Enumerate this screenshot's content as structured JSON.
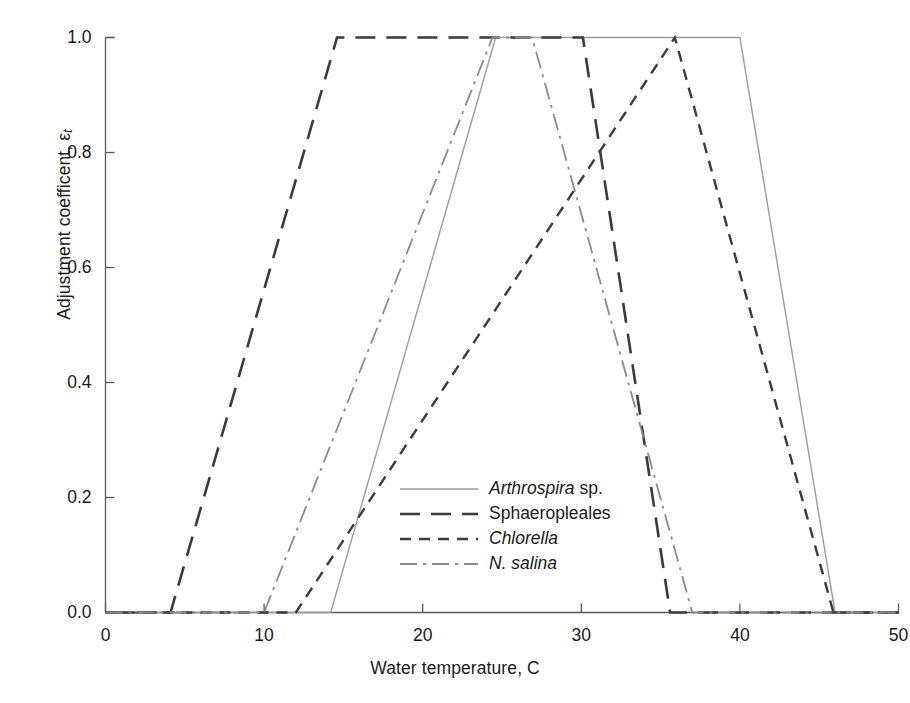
{
  "chart_data": {
    "type": "line",
    "title": "",
    "xlabel": "Water temperature, C",
    "ylabel": "Adjustment coefficent, ε",
    "ylabel_sub": "t",
    "xlim": [
      0,
      50
    ],
    "ylim": [
      0.0,
      1.0
    ],
    "xticks": [
      "0",
      "10",
      "20",
      "30",
      "40",
      "50"
    ],
    "xtick_values": [
      0,
      10,
      20,
      30,
      40,
      50
    ],
    "yticks": [
      "0.0",
      "0.2",
      "0.4",
      "0.6",
      "0.8",
      "1.0"
    ],
    "ytick_values": [
      0.0,
      0.2,
      0.4,
      0.6,
      0.8,
      1.0
    ],
    "grid": false,
    "legend_position": "center-right-inside",
    "series": [
      {
        "name": "Arthrospira sp.",
        "label_italic_part": "Arthrospira",
        "label_roman_part": "sp.",
        "dash": "solid",
        "color": "#9b9b9b",
        "width": 1.4,
        "points": [
          [
            0,
            0.0
          ],
          [
            14.2,
            0.0
          ],
          [
            24.6,
            1.0
          ],
          [
            40.0,
            1.0
          ],
          [
            46.0,
            0.0
          ],
          [
            50,
            0.0
          ]
        ]
      },
      {
        "name": "Sphaeropleales",
        "label_italic_part": "",
        "label_roman_part": "Sphaeropleales",
        "dash": "long-dash",
        "color": "#3b3b3b",
        "width": 2.6,
        "points": [
          [
            0,
            0.0
          ],
          [
            4.1,
            0.0
          ],
          [
            14.6,
            1.0
          ],
          [
            30.1,
            1.0
          ],
          [
            35.6,
            0.0
          ],
          [
            50,
            0.0
          ]
        ]
      },
      {
        "name": "Chlorella",
        "label_italic_part": "Chlorella",
        "label_roman_part": "",
        "dash": "short-dash",
        "color": "#3b3b3b",
        "width": 2.4,
        "points": [
          [
            0,
            0.0
          ],
          [
            12.0,
            0.0
          ],
          [
            35.9,
            1.0
          ],
          [
            45.9,
            0.0
          ],
          [
            50,
            0.0
          ]
        ]
      },
      {
        "name": "N. salina",
        "label_italic_part": "N. salina",
        "label_roman_part": "",
        "dash": "dash-dot",
        "color": "#8b8b8b",
        "width": 1.8,
        "points": [
          [
            0,
            0.0
          ],
          [
            10.0,
            0.0
          ],
          [
            24.4,
            1.0
          ],
          [
            26.9,
            1.0
          ],
          [
            37.0,
            0.0
          ],
          [
            50,
            0.0
          ]
        ]
      }
    ],
    "legend_entries": [
      {
        "sample": "solid",
        "italic": "Arthrospira",
        "roman": " sp."
      },
      {
        "sample": "long-dash",
        "italic": "",
        "roman": "Sphaeropleales"
      },
      {
        "sample": "short-dash",
        "italic": "Chlorella",
        "roman": ""
      },
      {
        "sample": "dash-dot",
        "italic": "N. salina",
        "roman": ""
      }
    ],
    "axis_color": "#5a5a5a"
  }
}
